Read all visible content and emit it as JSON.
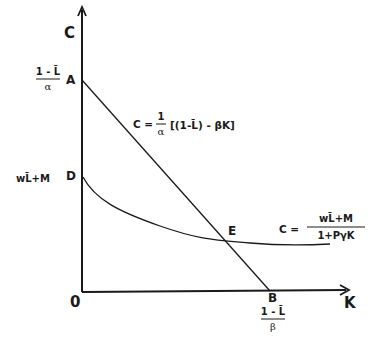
{
  "diagram": {
    "title": "",
    "axes": {
      "y_label": "C",
      "x_label": "K",
      "origin_label": "0"
    },
    "points": {
      "A": {
        "label": "A",
        "y_value_num": "1 - L̄",
        "y_value_den": "α"
      },
      "D": {
        "label": "D",
        "y_value": "wL̄+M"
      },
      "E": {
        "label": "E"
      },
      "B": {
        "label": "B",
        "x_value_num": "1 - L̄",
        "x_value_den": "β"
      }
    },
    "equations": {
      "line": {
        "lhs": "C =",
        "coef_num": "1",
        "coef_den": "α",
        "body": "[(1-L̄) - βK]"
      },
      "curve": {
        "lhs": "C =",
        "num": "wL̄+M",
        "den": "1+PγK"
      }
    },
    "colors": {
      "ink": "#1a1a1a",
      "background": "#ffffff"
    }
  }
}
